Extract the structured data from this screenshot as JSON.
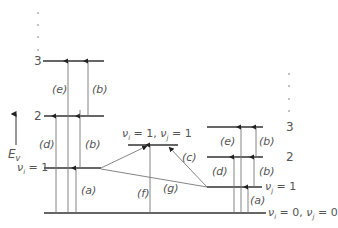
{
  "diagram": {
    "type": "vibrational energy level diagram (two modes)",
    "axis": {
      "label": "E",
      "subscript": "v"
    },
    "left_stack": {
      "levels": [
        {
          "label": "ν_i = 1",
          "text_main": "ν",
          "text_sub": "i",
          "text_rest": " = 1"
        },
        {
          "label": "2"
        },
        {
          "label": "3"
        }
      ],
      "transitions": [
        {
          "id": "a",
          "label": "(a)",
          "from": "0",
          "to": "1"
        },
        {
          "id": "b1",
          "label": "(b)",
          "from": "1",
          "to": "2"
        },
        {
          "id": "b2",
          "label": "(b)",
          "from": "2",
          "to": "3"
        },
        {
          "id": "d",
          "label": "(d)",
          "from": "0",
          "to": "2"
        },
        {
          "id": "e",
          "label": "(e)",
          "from": "0",
          "to": "3"
        }
      ]
    },
    "combination_level": {
      "label": "ν_i = 1, ν_j = 1",
      "p1": "ν",
      "s1": "i",
      "p2": " = 1, ",
      "p3": "ν",
      "s2": "j",
      "p4": " = 1"
    },
    "middle_transitions": [
      {
        "id": "f",
        "label": "(f)"
      },
      {
        "id": "g",
        "label": "(g)"
      },
      {
        "id": "c",
        "label": "(c)"
      }
    ],
    "right_stack": {
      "levels": [
        {
          "label": "ν_j = 1",
          "text_main": "ν",
          "text_sub": "j",
          "text_rest": " = 1"
        },
        {
          "label": "2"
        },
        {
          "label": "3"
        }
      ],
      "transitions": [
        {
          "id": "a",
          "label": "(a)"
        },
        {
          "id": "b1",
          "label": "(b)"
        },
        {
          "id": "b2",
          "label": "(b)"
        },
        {
          "id": "d",
          "label": "(d)"
        },
        {
          "id": "e",
          "label": "(e)"
        }
      ]
    },
    "ground_level": {
      "label": "ν_i = 0, ν_j = 0",
      "p1": "ν",
      "s1": "i",
      "p2": " = 0, ",
      "p3": "ν",
      "s2": "j",
      "p4": " = 0"
    },
    "colors": {
      "line": "#333333",
      "thin": "#777777",
      "text": "#555555"
    }
  }
}
